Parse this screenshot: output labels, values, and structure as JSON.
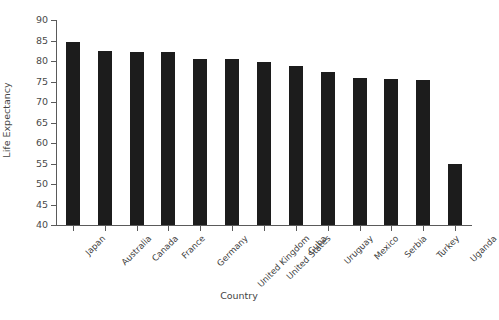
{
  "chart_data": {
    "type": "bar",
    "title": "",
    "subtitle": "",
    "xlabel": "Country",
    "ylabel": "Life Expectancy",
    "categories": [
      "Japan",
      "Australia",
      "Canada",
      "France",
      "Germany",
      "United Kingdom",
      "United States",
      "Cuba",
      "Uruguay",
      "Mexico",
      "Serbia",
      "Turkey",
      "Uganda"
    ],
    "values": [
      84.6,
      82.5,
      82.3,
      82.3,
      80.6,
      80.6,
      79.8,
      78.8,
      77.2,
      75.9,
      75.6,
      75.3,
      55.0
    ],
    "ylim": [
      40,
      90
    ],
    "yticks": [
      40,
      45,
      50,
      55,
      60,
      65,
      70,
      75,
      80,
      85,
      90
    ],
    "ytick_labels": [
      "40",
      "45",
      "50",
      "55",
      "60",
      "65",
      "70",
      "75",
      "80",
      "85",
      "90"
    ],
    "grid": false,
    "legend": null,
    "bar_color": "#1c1c1c",
    "axis_color": "#5a5a5a",
    "background": "#ffffff"
  }
}
